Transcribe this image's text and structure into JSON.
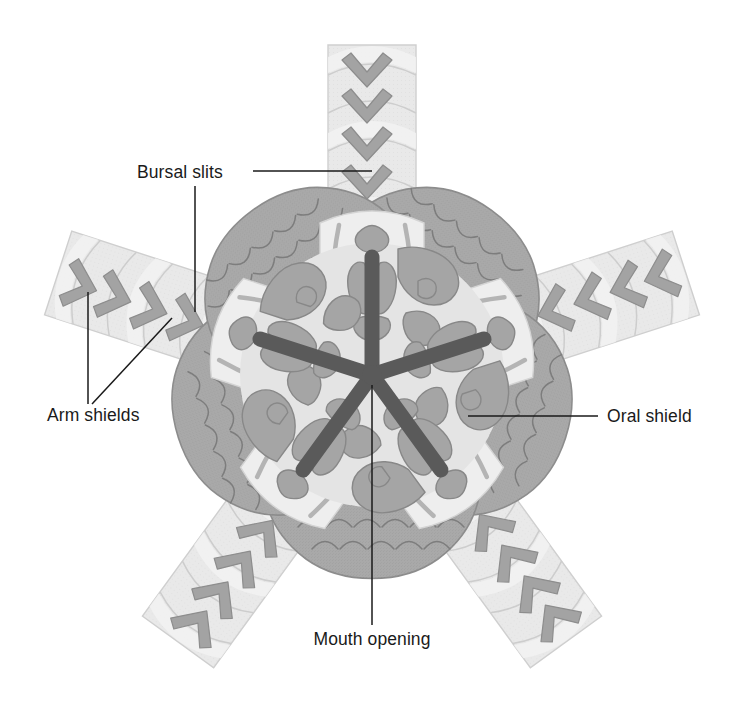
{
  "figure": {
    "symmetry": "pentaradial",
    "arm_count": 5,
    "background_color": "#ffffff"
  },
  "palette": {
    "page_background": "#ffffff",
    "disc_scale_fill": "#a9a9a9",
    "disc_scale_outline": "#7c7c7c",
    "disc_edge_outline": "#8d8d8d",
    "arm_fill": "#e9e9e9",
    "arm_band_light": "#f2f2f2",
    "arm_band_outline": "#cfcfcf",
    "arm_shield_fill": "#a3a3a3",
    "arm_shield_outline": "#8a8a8a",
    "oral_region_fill": "#e4e4e4",
    "oral_plate_fill": "#a5a5a5",
    "oral_plate_outline": "#858585",
    "bursal_slit_stripe": "#b4b4b4",
    "mouth_star_fill": "#5a5a5a",
    "label_text": "#1a1a1a",
    "leader_line": "#1a1a1a"
  },
  "labels": [
    {
      "id": "bursal-slits",
      "text": "Bursal slits",
      "text_x": 137,
      "text_y": 178,
      "anchor": "start",
      "leaders": [
        {
          "points": "253,171 372,171"
        },
        {
          "points": "195,186 195,312"
        }
      ]
    },
    {
      "id": "arm-shields",
      "text": "Arm shields",
      "text_x": 47,
      "text_y": 421,
      "anchor": "start",
      "leaders": [
        {
          "points": "88,404 88,292"
        },
        {
          "points": "92,404 172,318"
        }
      ]
    },
    {
      "id": "oral-shield",
      "text": "Oral shield",
      "text_x": 607,
      "text_y": 422,
      "anchor": "start",
      "leaders": [
        {
          "points": "598,416 468,416"
        }
      ]
    },
    {
      "id": "mouth-opening",
      "text": "Mouth opening",
      "text_x": 372,
      "text_y": 645,
      "anchor": "middle",
      "leaders": [
        {
          "points": "372,625 372,385"
        }
      ]
    }
  ],
  "anatomy": {
    "disc": {
      "name": "central-disc",
      "description": "Pentagonal disc with five interradial lobes, covered in overlapping crescent scales",
      "center": [
        372,
        375
      ],
      "radius": 210
    },
    "mouth": {
      "name": "mouth-opening",
      "description": "Dark five-rayed central mouth aperture",
      "center": [
        372,
        375
      ],
      "ray_count": 5,
      "ray_length": 118
    },
    "arms": [
      {
        "index": 1,
        "angle_deg": -90,
        "name": "arm-top"
      },
      {
        "index": 2,
        "angle_deg": -18,
        "name": "arm-upper-right"
      },
      {
        "index": 3,
        "angle_deg": 54,
        "name": "arm-lower-right"
      },
      {
        "index": 4,
        "angle_deg": 126,
        "name": "arm-lower-left"
      },
      {
        "index": 5,
        "angle_deg": 198,
        "name": "arm-upper-left"
      }
    ],
    "bursal_slits": {
      "name": "bursal-slits",
      "description": "Paired elongate slits flanking each arm base",
      "count_per_arm": 2
    },
    "oral_shields": {
      "name": "oral-shields",
      "description": "Large interradial plates bordering each arm base",
      "count": 5
    },
    "arm_shields": {
      "name": "arm-shields",
      "description": "Chevron-shaped ventral plates along each arm",
      "per_arm": 9
    }
  }
}
